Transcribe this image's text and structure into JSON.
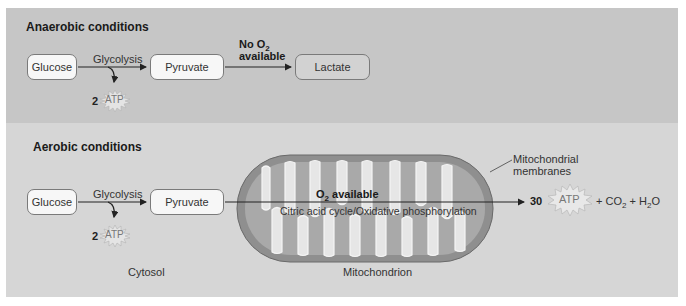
{
  "anaerobic": {
    "title": "Anaerobic conditions",
    "glucose": "Glucose",
    "glycolysis": "Glycolysis",
    "pyruvate": "Pyruvate",
    "no_o2_line1": "No O",
    "no_o2_sub": "2",
    "no_o2_line2": "available",
    "lactate": "Lactate",
    "atp_count": "2",
    "atp_label": "ATP"
  },
  "aerobic": {
    "title": "Aerobic conditions",
    "glucose": "Glucose",
    "glycolysis": "Glycolysis",
    "pyruvate": "Pyruvate",
    "atp_count": "2",
    "atp_label": "ATP",
    "o2_prefix": "O",
    "o2_sub": "2",
    "o2_suffix": " available",
    "cycle_label": "Citric acid cycle/Oxidative phosphorylation",
    "membranes_line1": "Mitochondrial",
    "membranes_line2": "membranes",
    "atp_count_final": "30",
    "atp_label_final": "ATP",
    "products_co2": "+ CO",
    "products_co2_sub": "2",
    "products_h2o_pre": " + H",
    "products_h2o_sub": "2",
    "products_h2o_post": "O",
    "cytosol": "Cytosol",
    "mitochondrion": "Mitochondrion"
  },
  "colors": {
    "top_panel": "#c6c6c6",
    "bottom_panel": "#d6d6d6",
    "mito_outer": "#8f8f8f",
    "mito_inner": "#a9a9a9",
    "cristae": "#e6e6e6"
  }
}
